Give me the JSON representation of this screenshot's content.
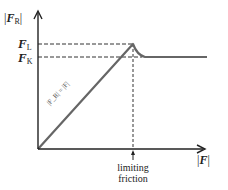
{
  "diagram": {
    "y_axis": {
      "label_bar_left": "|",
      "label_main": "F",
      "label_sub": "R",
      "label_bar_right": "|"
    },
    "x_axis": {
      "label_bar_left": "|",
      "label_main": "F",
      "label_bar_right": "|"
    },
    "levels": [
      {
        "id": "limiting",
        "main": "F",
        "sub": "L"
      },
      {
        "id": "kinetic",
        "main": "F",
        "sub": "K"
      }
    ],
    "line_annotation": "|F_R| = |F|",
    "marker_caption_line1": "limiting",
    "marker_caption_line2": "friction",
    "colors": {
      "curve": "#666666",
      "axes": "#222222",
      "dashed": "#333333"
    }
  }
}
